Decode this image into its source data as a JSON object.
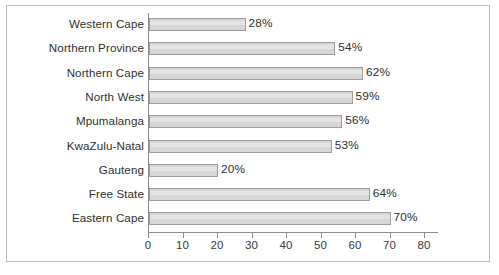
{
  "chart_data": {
    "type": "bar",
    "orientation": "horizontal",
    "title": "",
    "subtitle": "",
    "xlabel": "",
    "ylabel": "",
    "categories": [
      "Western Cape",
      "Northern Province",
      "Northern Cape",
      "North West",
      "Mpumalanga",
      "KwaZulu-Natal",
      "Gauteng",
      "Free State",
      "Eastern Cape"
    ],
    "values": [
      28,
      54,
      62,
      59,
      56,
      53,
      20,
      64,
      70
    ],
    "value_labels": [
      "28%",
      "54%",
      "62%",
      "59%",
      "56%",
      "53%",
      "20%",
      "64%",
      "70%"
    ],
    "xlim": [
      0,
      80
    ],
    "xticks": [
      0,
      10,
      20,
      30,
      40,
      50,
      60,
      70,
      80
    ],
    "xtick_labels": [
      "0",
      "10",
      "20",
      "30",
      "40",
      "50",
      "60",
      "70",
      "80"
    ],
    "grid": false,
    "legend": null,
    "bar_fill_color": "#d6d6d6",
    "bar_border_color": "#9d9d9d",
    "axis_color": "#8c8c8c",
    "text_color": "#2f2f2f",
    "frame_color": "#b9b9b9",
    "background_color": "#ffffff"
  }
}
